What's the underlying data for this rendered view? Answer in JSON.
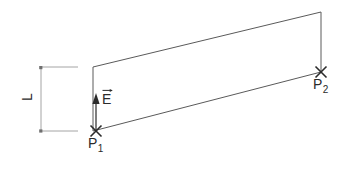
{
  "diagram": {
    "background_color": "#ffffff",
    "stroke_color": "#2b2b2b",
    "thin_stroke_color": "#8c8c8c",
    "width": 343,
    "height": 169,
    "labels": {
      "length_label": "L",
      "field_label": "E",
      "field_vector_accent": "arrow-right",
      "point1_base": "P",
      "point1_subscript": "1",
      "point2_base": "P",
      "point2_subscript": "2"
    },
    "shapes": {
      "plane_name": "parallelogram-plane",
      "plane_points": "93,67 321,12 321,72 93,131",
      "dimension_name": "length-dimension-L",
      "dimension_line_x": 41,
      "dimension_top_y": 67,
      "dimension_bottom_y": 131,
      "extension_line_end_x": 78,
      "field_arrow_name": "field-vector-arrow",
      "field_arrow_x": 96,
      "field_arrow_tail_y": 131,
      "field_arrow_head_y": 94,
      "marker_p1_x": 96,
      "marker_p1_y": 131,
      "marker_p2_x": 321,
      "marker_p2_y": 72,
      "marker_radius": 6
    }
  }
}
